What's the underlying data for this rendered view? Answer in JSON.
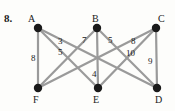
{
  "figure": {
    "problem_number": "8.",
    "type": "weighted-graph-diagram",
    "edge_color": "#9a9a9a",
    "vertex_color": "#1a1a1a",
    "text_color": "#1a1a1a",
    "background": "#fdfdfb"
  },
  "graph": {
    "vertices": [
      {
        "id": "A",
        "label": "A",
        "x": 38,
        "y": 28,
        "label_x": 28,
        "label_y": 14
      },
      {
        "id": "B",
        "label": "B",
        "x": 97,
        "y": 28,
        "label_x": 92,
        "label_y": 14
      },
      {
        "id": "C",
        "label": "C",
        "x": 156,
        "y": 28,
        "label_x": 158,
        "label_y": 14
      },
      {
        "id": "F",
        "label": "F",
        "x": 38,
        "y": 88,
        "label_x": 33,
        "label_y": 95
      },
      {
        "id": "E",
        "label": "E",
        "x": 98,
        "y": 88,
        "label_x": 93,
        "label_y": 95
      },
      {
        "id": "D",
        "label": "D",
        "x": 157,
        "y": 88,
        "label_x": 155,
        "label_y": 95
      }
    ],
    "edges": [
      {
        "from": "A",
        "to": "F",
        "weight": "8",
        "label_x": 31,
        "label_y": 54
      },
      {
        "from": "A",
        "to": "E",
        "weight": "3",
        "label_x": 58,
        "label_y": 37
      },
      {
        "from": "A",
        "to": "D",
        "weight": "5",
        "label_x": 58,
        "label_y": 48
      },
      {
        "from": "B",
        "to": "F",
        "weight": "7",
        "label_x": 82,
        "label_y": 36
      },
      {
        "from": "B",
        "to": "E",
        "weight": "4",
        "label_x": 92,
        "label_y": 70
      },
      {
        "from": "B",
        "to": "D",
        "weight": "5",
        "label_x": 108,
        "label_y": 36
      },
      {
        "from": "C",
        "to": "F",
        "weight": "10",
        "label_x": 126,
        "label_y": 49
      },
      {
        "from": "C",
        "to": "E",
        "weight": "8",
        "label_x": 131,
        "label_y": 37
      },
      {
        "from": "C",
        "to": "D",
        "weight": "9",
        "label_x": 148,
        "label_y": 57
      }
    ]
  }
}
